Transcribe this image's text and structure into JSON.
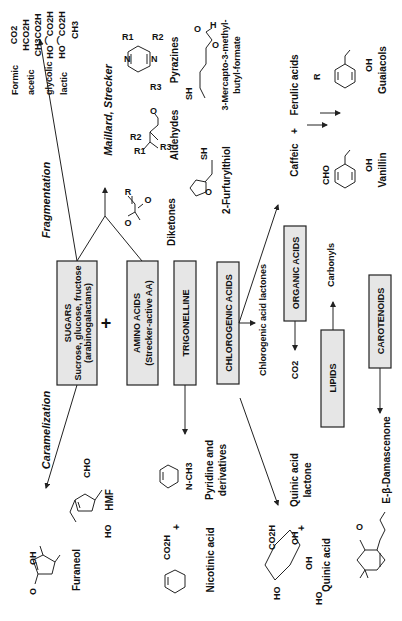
{
  "diagram": {
    "orientation": "rotated 90 degrees counter-clockwise",
    "precursor_boxes": [
      {
        "id": "sugars",
        "title": "SUGARS",
        "line2": "Sucrose, glucose, fructose",
        "line3": "(arabinogalactans)"
      },
      {
        "id": "amino_acids",
        "title": "AMINO ACIDS",
        "line2": "(Strecker-active AA)"
      },
      {
        "id": "trigonelline",
        "title": "TRIGONELLINE"
      },
      {
        "id": "chlorogenic_acids",
        "title": "CHLOROGENIC ACIDS"
      },
      {
        "id": "organic_acids",
        "title": "ORGANIC ACIDS"
      },
      {
        "id": "lipids",
        "title": "LIPIDS"
      },
      {
        "id": "carotenoids",
        "title": "CAROTENOIDS"
      }
    ],
    "plus_sign": "+",
    "process_labels": {
      "fragmentation": "Fragmentation",
      "maillard_strecker": "Maillard,  Strecker",
      "caramelization": "Caramelization"
    },
    "fragmentation_products": {
      "formulas": [
        "CO2",
        "HCO2H",
        "CH3CO2H",
        "HO⌒CO2H",
        "HO⌒CO2H",
        "CH3"
      ],
      "acid_names": [
        "Formic",
        "acetic",
        "glycolic",
        "lactic"
      ]
    },
    "maillard_products": {
      "diketones": "Diketones",
      "aldehydes": "Aldehydes",
      "pyrazines": "Pyrazines",
      "furfurylthiol": "2-Furfurylthiol",
      "mercapto_line1": "3-Mercapto-3-methyl-",
      "mercapto_line2": "butyl-formate",
      "substituents": {
        "r": "R",
        "r1": "R1",
        "r2": "R2",
        "r3": "R3",
        "o": "O",
        "sh": "SH",
        "h": "H",
        "n": "N"
      }
    },
    "phenolic_products": {
      "caffeic": "Caffeic",
      "plus": "+",
      "ferulic": "Ferulic acids",
      "vanillin": "Vanillin",
      "guaiacols": "Guaiacols",
      "cho": "CHO",
      "oh": "OH",
      "r": "R"
    },
    "chlorogenic_products": {
      "lactones": "Chlorogenic acid lactones",
      "quinic_lactone_line1": "Quinic acid",
      "quinic_lactone_line2": "lactone",
      "quinic_acid": "Quinic acid",
      "co2h": "CO2H",
      "oh": "OH",
      "ho": "HO"
    },
    "organic_acid_products": {
      "co2": "CO2"
    },
    "lipid_products": {
      "carbonyls": "Carbonyls"
    },
    "carotenoid_products": {
      "damascenone": "E-β-Damascenone"
    },
    "trigonelline_products": {
      "pyridine_line1": "Pyridine and",
      "pyridine_line2": "derivatives",
      "nicotinic": "Nicotinic acid",
      "co2h": "CO2H",
      "n_ch3": "N-CH3",
      "plus": "+"
    },
    "caramel_products": {
      "hmf": "HMF",
      "furaneol": "Furaneol",
      "cho": "CHO",
      "ho": "HO",
      "oh": "OH",
      "o": "O"
    },
    "colors": {
      "box_fill": "#e6e6e6",
      "stroke": "#222222",
      "background": "#ffffff"
    }
  }
}
